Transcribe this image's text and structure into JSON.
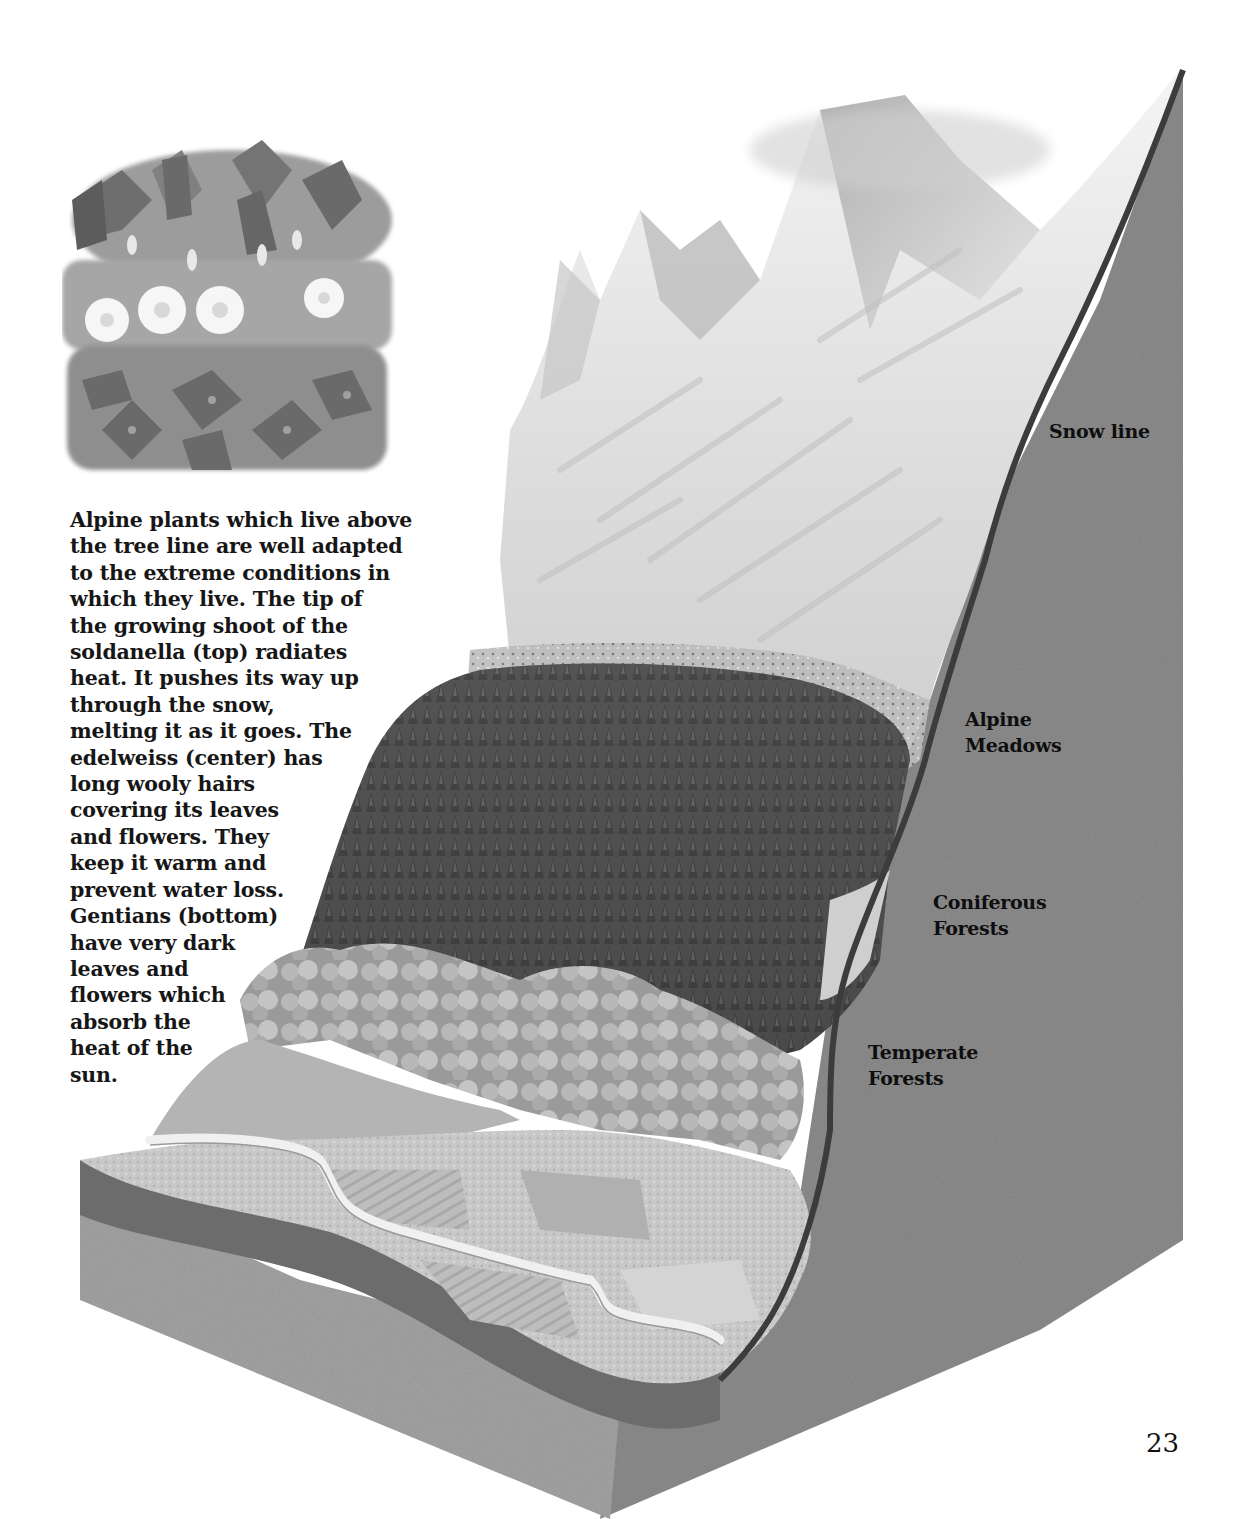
{
  "page": {
    "page_number": "23"
  },
  "inset_illustration": {
    "subject": "alpine plants",
    "rows": [
      "soldanella (top)",
      "edelweiss (center)",
      "gentians (bottom)"
    ]
  },
  "caption": {
    "lines": [
      "Alpine plants which live above",
      "the tree line are well adapted",
      "to the extreme conditions in",
      "which they live. The tip of",
      "the growing shoot of the",
      "soldanella (top) radiates",
      "heat. It pushes its way up",
      "through the snow,",
      "melting it as it goes. The",
      "edelweiss (center) has",
      "long wooly hairs",
      "covering its leaves",
      "and flowers. They",
      "keep it warm and",
      "prevent water loss.",
      "Gentians (bottom)",
      "have very dark",
      "leaves and",
      "flowers which",
      "absorb the",
      "heat of the",
      "sun."
    ]
  },
  "diagram": {
    "title_hint": "mountain vegetation zones cross-section",
    "zones": [
      {
        "id": "snow-line",
        "lines": [
          "Snow line"
        ]
      },
      {
        "id": "alpine-meadows",
        "lines": [
          "Alpine",
          "Meadows"
        ]
      },
      {
        "id": "coniferous-forests",
        "lines": [
          "Coniferous",
          "Forests"
        ]
      },
      {
        "id": "temperate-forests",
        "lines": [
          "Temperate",
          "Forests"
        ]
      }
    ],
    "colors": {
      "rock_face": "#8a8a8a",
      "rock_front": "#9c9c9c",
      "snow": "#ececec",
      "conifers": "#4a4a4a",
      "deciduous": "#a8a8a8",
      "fields": "#c4c4c4",
      "river": "#f2f2f2"
    }
  }
}
